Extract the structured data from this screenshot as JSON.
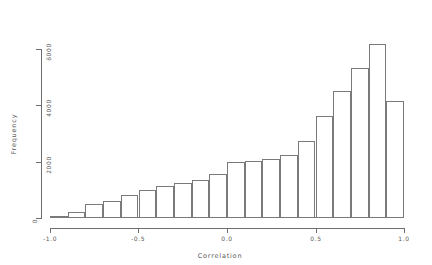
{
  "chart_data": {
    "type": "bar",
    "title": "",
    "subtitle": "",
    "xlabel": "Correlation",
    "ylabel": "Frequency",
    "xlim": [
      -1.0,
      1.0
    ],
    "ylim": [
      0,
      6800
    ],
    "grid": false,
    "legend": null,
    "bin_width": 0.1,
    "xticks": [
      -1.0,
      -0.5,
      0.0,
      0.5,
      1.0
    ],
    "xtick_labels": [
      "-1.0",
      "-0.5",
      "0.0",
      "0.5",
      "1.0"
    ],
    "yticks": [
      0,
      2000,
      4000,
      6000
    ],
    "ytick_labels": [
      "0",
      "2000",
      "4000",
      "6000"
    ],
    "bin_edges": [
      -1.0,
      -0.9,
      -0.8,
      -0.7,
      -0.6,
      -0.5,
      -0.4,
      -0.3,
      -0.2,
      -0.1,
      0.0,
      0.1,
      0.2,
      0.3,
      0.4,
      0.5,
      0.6,
      0.7,
      0.8,
      0.9,
      1.0
    ],
    "categories": [
      "-1.0--0.9",
      "-0.9--0.8",
      "-0.8--0.7",
      "-0.7--0.6",
      "-0.6--0.5",
      "-0.5--0.4",
      "-0.4--0.3",
      "-0.3--0.2",
      "-0.2--0.1",
      "-0.1-0.0",
      "0.0-0.1",
      "0.1-0.2",
      "0.2-0.3",
      "0.3-0.4",
      "0.4-0.5",
      "0.5-0.6",
      "0.6-0.7",
      "0.7-0.8",
      "0.8-0.9",
      "0.9-1.0"
    ],
    "values": [
      60,
      230,
      480,
      620,
      820,
      1000,
      1120,
      1260,
      1350,
      1570,
      1980,
      2020,
      2100,
      2220,
      2740,
      3630,
      4500,
      5320,
      6160,
      6880
    ],
    "last_bar_value": 4140,
    "note_last_bar": "final bin 0.9-1.0 drops to 4140"
  },
  "axes": {
    "x_axis_name": "x-axis",
    "y_axis_name": "y-axis"
  }
}
